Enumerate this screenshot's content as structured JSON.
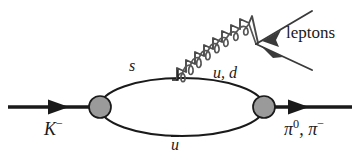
{
  "figure": {
    "type": "feynman-diagram",
    "background_color": "#ffffff",
    "line_color": "#1a1a1a",
    "vertex_fill_color": "#9a9a9a",
    "vertex_stroke_color": "#1a1a1a"
  },
  "labels": {
    "incoming_particle": "K",
    "incoming_particle_charge": "−",
    "outgoing_particle_1": "π",
    "outgoing_particle_1_charge": "0",
    "outgoing_separator": ", ",
    "outgoing_particle_2": "π",
    "outgoing_particle_2_charge": "−",
    "quark_top": "s",
    "quark_loop": "u, d",
    "quark_bottom": "u",
    "leptons": "leptons"
  },
  "geometry": {
    "canvas_width": 359,
    "canvas_height": 161,
    "loop_center_x": 182,
    "loop_center_y": 107,
    "loop_radius_x": 82,
    "loop_radius_y": 29,
    "left_vertex_x": 100,
    "left_vertex_y": 107,
    "right_vertex_x": 264,
    "right_vertex_y": 107,
    "vertex_radius": 11,
    "incoming_line_start_x": 8,
    "outgoing_line_end_x": 352,
    "photon_start_x": 177,
    "photon_start_y": 79,
    "photon_end_x": 258,
    "photon_end_y": 43,
    "lepton_vertex_x": 258,
    "lepton_vertex_y": 43,
    "lepton_upper_end_x": 310,
    "lepton_upper_end_y": 12,
    "lepton_lower_end_x": 310,
    "lepton_lower_end_y": 66
  }
}
